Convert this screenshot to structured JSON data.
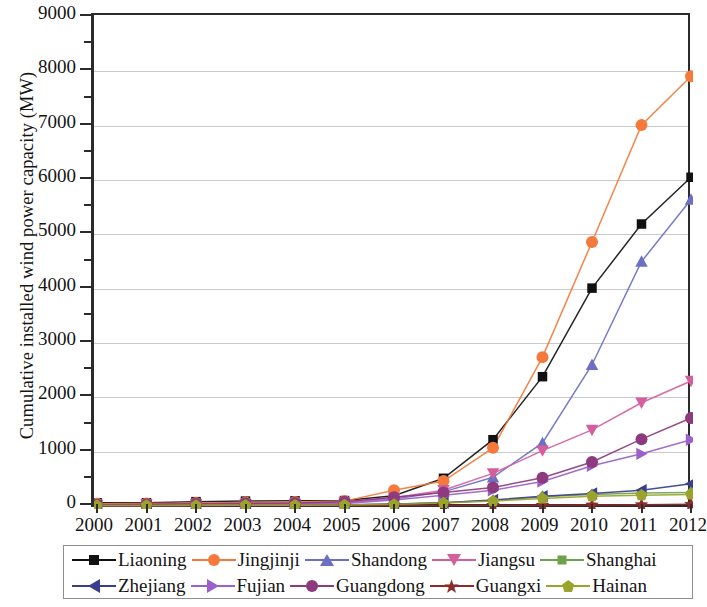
{
  "chart_data": {
    "type": "line",
    "title": "",
    "xlabel": "",
    "ylabel": "Cumulative installed wind power capacity (MW)",
    "xlim": [
      2000,
      2012
    ],
    "ylim": [
      0,
      9000
    ],
    "ytick_step": 1000,
    "yminor_step": 500,
    "grid": true,
    "legend_position": "bottom",
    "categories": [
      2000,
      2001,
      2002,
      2003,
      2004,
      2005,
      2006,
      2007,
      2008,
      2009,
      2010,
      2011,
      2012
    ],
    "xtick_labels": [
      "2000",
      "2001",
      "2002",
      "2003",
      "2004",
      "2005",
      "2006",
      "2007",
      "2008",
      "2009",
      "2010",
      "2011",
      "2012"
    ],
    "ytick_labels": [
      "0",
      "1000",
      "2000",
      "3000",
      "4000",
      "5000",
      "6000",
      "7000",
      "8000",
      "9000"
    ],
    "series": [
      {
        "name": "Liaoning",
        "color": "#111111",
        "marker": "square",
        "values": [
          60,
          60,
          80,
          90,
          95,
          100,
          190,
          510,
          1220,
          2380,
          4010,
          5190,
          6050
        ]
      },
      {
        "name": "Jingjinji",
        "color": "#F4793B",
        "marker": "circle",
        "values": [
          40,
          45,
          55,
          65,
          75,
          90,
          290,
          460,
          1070,
          2740,
          4860,
          7010,
          7910
        ]
      },
      {
        "name": "Shandong",
        "color": "#6C6FC4",
        "marker": "tri-up",
        "values": [
          20,
          25,
          30,
          35,
          40,
          70,
          130,
          260,
          530,
          1160,
          2600,
          4500,
          5640
        ]
      },
      {
        "name": "Jiangsu",
        "color": "#D55E9E",
        "marker": "tri-dn",
        "values": [
          20,
          25,
          30,
          35,
          40,
          60,
          150,
          290,
          600,
          1020,
          1400,
          1900,
          2300
        ]
      },
      {
        "name": "Shanghai",
        "color": "#6FA34B",
        "marker": "diamond",
        "values": [
          5,
          8,
          10,
          12,
          15,
          20,
          30,
          60,
          100,
          170,
          210,
          240,
          250
        ]
      },
      {
        "name": "Zhejiang",
        "color": "#3B3E8C",
        "marker": "tri-lf",
        "values": [
          10,
          12,
          15,
          18,
          20,
          25,
          35,
          60,
          110,
          180,
          230,
          290,
          410
        ]
      },
      {
        "name": "Fujian",
        "color": "#9C61C9",
        "marker": "tri-rt",
        "values": [
          15,
          18,
          22,
          26,
          30,
          45,
          110,
          200,
          290,
          450,
          740,
          960,
          1220
        ]
      },
      {
        "name": "Guangdong",
        "color": "#8E3A7E",
        "marker": "circle",
        "values": [
          25,
          30,
          40,
          50,
          55,
          80,
          160,
          250,
          340,
          520,
          810,
          1230,
          1620
        ]
      },
      {
        "name": "Guangxi",
        "color": "#8C2B2B",
        "marker": "star",
        "values": [
          2,
          3,
          3,
          4,
          5,
          6,
          8,
          10,
          12,
          15,
          18,
          22,
          30
        ]
      },
      {
        "name": "Hainan",
        "color": "#9AA32C",
        "marker": "pentagon",
        "values": [
          8,
          10,
          12,
          14,
          16,
          20,
          30,
          55,
          90,
          140,
          180,
          200,
          210
        ]
      }
    ]
  },
  "legend": {
    "rows": [
      [
        "Liaoning",
        "Jingjinji",
        "Shandong",
        "Jiangsu",
        "Shanghai"
      ],
      [
        "Zhejiang",
        "Fujian",
        "Guangdong",
        "Guangxi",
        "Hainan"
      ]
    ]
  },
  "icons": {
    "square": "square-marker-icon",
    "circle": "circle-marker-icon",
    "tri-up": "triangle-up-marker-icon",
    "tri-dn": "triangle-down-marker-icon",
    "tri-lf": "triangle-left-marker-icon",
    "tri-rt": "triangle-right-marker-icon",
    "diamond": "diamond-marker-icon",
    "star": "star-marker-icon",
    "pentagon": "pentagon-marker-icon"
  },
  "star_glyph": "★"
}
